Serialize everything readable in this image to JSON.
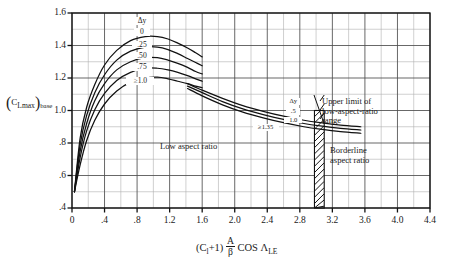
{
  "chart_data": {
    "type": "line",
    "title": "",
    "xlabel": "(C1+1) A/β COS ΛLE",
    "ylabel": "(CLmax)base",
    "xlim": [
      0,
      4.4
    ],
    "ylim": [
      0.4,
      1.6
    ],
    "grid": true,
    "x_ticks": [
      "0",
      ".4",
      ".8",
      "1.2",
      "1.6",
      "2.0",
      "2.4",
      "2.8",
      "3.2",
      "3.6",
      "4.0",
      "4.4"
    ],
    "x_tick_values": [
      0,
      0.4,
      0.8,
      1.2,
      1.6,
      2.0,
      2.4,
      2.8,
      3.2,
      3.6,
      4.0,
      4.4
    ],
    "y_ticks": [
      "1.6",
      "1.4",
      "1.2",
      "1.0",
      ".8",
      ".6",
      ".4"
    ],
    "y_tick_values": [
      1.6,
      1.4,
      1.2,
      1.0,
      0.8,
      0.6,
      0.4
    ],
    "x_minor_step": 0.2,
    "y_minor_step": 0.1,
    "legend_position": "inline-curve-labels",
    "series": [
      {
        "name": "Δy = 0",
        "group": "low-aspect-ratio",
        "label": "0",
        "points": [
          [
            0.03,
            0.5
          ],
          [
            0.1,
            0.83
          ],
          [
            0.18,
            1.02
          ],
          [
            0.28,
            1.16
          ],
          [
            0.4,
            1.28
          ],
          [
            0.55,
            1.37
          ],
          [
            0.72,
            1.43
          ],
          [
            0.9,
            1.455
          ],
          [
            1.05,
            1.455
          ],
          [
            1.18,
            1.44
          ],
          [
            1.3,
            1.415
          ],
          [
            1.42,
            1.385
          ],
          [
            1.52,
            1.355
          ],
          [
            1.6,
            1.33
          ]
        ]
      },
      {
        "name": "Δy = .25",
        "group": "low-aspect-ratio",
        "label": ".25",
        "points": [
          [
            0.03,
            0.5
          ],
          [
            0.1,
            0.79
          ],
          [
            0.18,
            0.97
          ],
          [
            0.28,
            1.11
          ],
          [
            0.4,
            1.22
          ],
          [
            0.55,
            1.31
          ],
          [
            0.72,
            1.365
          ],
          [
            0.9,
            1.39
          ],
          [
            1.05,
            1.39
          ],
          [
            1.18,
            1.375
          ],
          [
            1.3,
            1.35
          ],
          [
            1.42,
            1.32
          ],
          [
            1.52,
            1.295
          ],
          [
            1.6,
            1.275
          ]
        ]
      },
      {
        "name": "Δy = .50",
        "group": "low-aspect-ratio",
        "label": ".50",
        "points": [
          [
            0.03,
            0.5
          ],
          [
            0.1,
            0.75
          ],
          [
            0.18,
            0.92
          ],
          [
            0.28,
            1.06
          ],
          [
            0.4,
            1.165
          ],
          [
            0.55,
            1.25
          ],
          [
            0.72,
            1.3
          ],
          [
            0.9,
            1.325
          ],
          [
            1.05,
            1.325
          ],
          [
            1.18,
            1.31
          ],
          [
            1.3,
            1.29
          ],
          [
            1.42,
            1.265
          ],
          [
            1.52,
            1.24
          ],
          [
            1.6,
            1.225
          ]
        ]
      },
      {
        "name": "Δy = .75",
        "group": "low-aspect-ratio",
        "label": ".75",
        "points": [
          [
            0.03,
            0.5
          ],
          [
            0.1,
            0.71
          ],
          [
            0.18,
            0.875
          ],
          [
            0.28,
            1.005
          ],
          [
            0.4,
            1.105
          ],
          [
            0.55,
            1.185
          ],
          [
            0.72,
            1.235
          ],
          [
            0.9,
            1.26
          ],
          [
            1.05,
            1.26
          ],
          [
            1.18,
            1.25
          ],
          [
            1.3,
            1.235
          ],
          [
            1.42,
            1.215
          ],
          [
            1.52,
            1.195
          ],
          [
            1.6,
            1.18
          ]
        ]
      },
      {
        "name": "Δy ≥ 1.0",
        "group": "low-aspect-ratio",
        "label": "≥1.0",
        "points": [
          [
            0.03,
            0.5
          ],
          [
            0.1,
            0.665
          ],
          [
            0.18,
            0.815
          ],
          [
            0.28,
            0.94
          ],
          [
            0.4,
            1.04
          ],
          [
            0.55,
            1.12
          ],
          [
            0.72,
            1.175
          ],
          [
            0.9,
            1.2
          ],
          [
            1.05,
            1.205
          ],
          [
            1.18,
            1.195
          ],
          [
            1.3,
            1.18
          ],
          [
            1.42,
            1.165
          ],
          [
            1.52,
            1.15
          ],
          [
            1.6,
            1.14
          ]
        ]
      },
      {
        "name": "Δy = .5 (high aspect ratio)",
        "group": "high-aspect-ratio",
        "label": ".5",
        "points": [
          [
            1.42,
            1.165
          ],
          [
            1.6,
            1.125
          ],
          [
            1.85,
            1.075
          ],
          [
            2.1,
            1.03
          ],
          [
            2.35,
            0.995
          ],
          [
            2.6,
            0.965
          ],
          [
            2.85,
            0.94
          ],
          [
            3.05,
            0.925
          ],
          [
            3.3,
            0.91
          ],
          [
            3.55,
            0.9
          ]
        ]
      },
      {
        "name": "Δy = 1.0 (high aspect ratio)",
        "group": "high-aspect-ratio",
        "label": "1.0",
        "points": [
          [
            1.42,
            1.15
          ],
          [
            1.6,
            1.11
          ],
          [
            1.85,
            1.055
          ],
          [
            2.1,
            1.01
          ],
          [
            2.35,
            0.975
          ],
          [
            2.6,
            0.945
          ],
          [
            2.85,
            0.92
          ],
          [
            3.05,
            0.905
          ],
          [
            3.3,
            0.89
          ],
          [
            3.55,
            0.88
          ]
        ]
      },
      {
        "name": "Δy ≥ 1.35 (high aspect ratio)",
        "group": "high-aspect-ratio",
        "label": "≥1.35",
        "points": [
          [
            1.42,
            1.135
          ],
          [
            1.6,
            1.09
          ],
          [
            1.85,
            1.035
          ],
          [
            2.1,
            0.99
          ],
          [
            2.35,
            0.955
          ],
          [
            2.6,
            0.925
          ],
          [
            2.85,
            0.9
          ],
          [
            3.05,
            0.885
          ],
          [
            3.3,
            0.87
          ],
          [
            3.55,
            0.86
          ]
        ]
      }
    ],
    "hatched_band": {
      "label": "upper limit of low-aspect-ratio range",
      "x_start": 2.98,
      "x_end": 3.1,
      "y_start": 0.4,
      "y_end": 1.0
    },
    "annotations": [
      {
        "id": "delta-y-left",
        "text": "Δy",
        "x": 0.86,
        "y": 1.545
      },
      {
        "id": "low-aspect-ratio",
        "text": "Low aspect ratio",
        "x": 1.5,
        "y": 0.8
      },
      {
        "id": "delta-y-right",
        "text": "Δy",
        "x": 2.72,
        "y": 1.045
      },
      {
        "id": "upper-limit",
        "text": "Upper limit of low-aspect-ratio range",
        "x": 3.18,
        "y": 1.01
      },
      {
        "id": "borderline",
        "text": "Borderline aspect ratio",
        "x": 3.3,
        "y": 0.77
      }
    ]
  },
  "axis_labels": {
    "y_prefix": "C",
    "y_sub": "L",
    "y_sub2": "max",
    "y_suffix": "base",
    "x_c": "C",
    "x_c_sub": "l",
    "x_plus1": "+1)",
    "x_open": "(",
    "x_num": "A",
    "x_den": "β",
    "x_cos": "COS",
    "x_lambda": "Λ",
    "x_lambda_sub": "LE"
  },
  "annotation_text": {
    "upper_limit_line1": "Upper limit of",
    "upper_limit_line2": "low-aspect-ratio",
    "upper_limit_line3": "range",
    "borderline_line1": "Borderline",
    "borderline_line2": "aspect ratio",
    "low_aspect_ratio": "Low aspect ratio",
    "delta_y": "Δy"
  },
  "colors": {
    "curve": "#111111",
    "grid_major": "#4d4d4d",
    "grid_minor": "#b0b0b0",
    "axis": "#111111",
    "background": "#ffffff"
  }
}
